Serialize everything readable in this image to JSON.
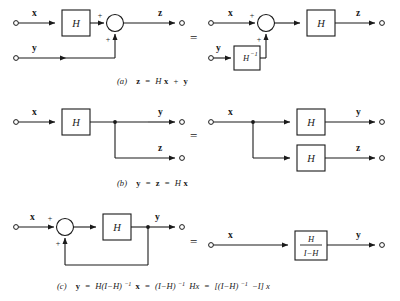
{
  "figure": {
    "rows": [
      {
        "id": "row-a",
        "caption": {
          "tag": "(a)",
          "text": "z = Hx + y",
          "parts": [
            "(a)",
            "z",
            "=",
            "H",
            "x",
            "+",
            "y"
          ]
        },
        "left": {
          "inputs": [
            "x",
            "y"
          ],
          "outputs": [
            "z"
          ],
          "blocks": [
            "H"
          ],
          "signs": [
            "+",
            "+"
          ]
        },
        "right": {
          "inputs": [
            "x",
            "y"
          ],
          "outputs": [
            "z"
          ],
          "blocks": [
            "H",
            "H⁻¹"
          ],
          "signs": [
            "+",
            "+"
          ]
        },
        "equals": "="
      },
      {
        "id": "row-b",
        "caption": {
          "tag": "(b)",
          "text": "y = z = Hx",
          "parts": [
            "(b)",
            "y",
            "=",
            "z",
            "=",
            "H",
            "x"
          ]
        },
        "left": {
          "inputs": [
            "x"
          ],
          "outputs": [
            "y",
            "z"
          ],
          "blocks": [
            "H"
          ],
          "signs": []
        },
        "right": {
          "inputs": [
            "x"
          ],
          "outputs": [
            "y",
            "z"
          ],
          "blocks": [
            "H",
            "H"
          ],
          "signs": []
        },
        "equals": "="
      },
      {
        "id": "row-c",
        "caption": {
          "tag": "(c)",
          "text": "y = H(I−H)⁻¹ x = (I−H)⁻¹ Hx = [(I−H)⁻¹ −I] x",
          "parts": [
            "(c)",
            "y",
            "=",
            "H(I−H)",
            "−1",
            "x",
            "=",
            "(I−H)",
            "−1",
            "Hx",
            "=",
            "[(I−H)",
            "−1",
            "−I] x"
          ]
        },
        "left": {
          "inputs": [
            "x"
          ],
          "outputs": [
            "y"
          ],
          "blocks": [
            "H"
          ],
          "signs": [
            "+",
            "+"
          ],
          "feedback": true
        },
        "right": {
          "inputs": [
            "x"
          ],
          "outputs": [
            "y"
          ],
          "blocks": [
            "H / I−H"
          ],
          "numerator": "H",
          "denominator": "I−H",
          "signs": []
        },
        "equals": "="
      }
    ],
    "labels": {
      "x": "x",
      "y": "y",
      "z": "z",
      "H": "H",
      "H_inv_base": "H",
      "H_inv_sup": "−1",
      "plus": "+",
      "equals": "=",
      "numerator": "H",
      "denominator": "I−H"
    },
    "colors": {
      "ink": "#1a1a1a",
      "paper": "#ffffff"
    }
  }
}
